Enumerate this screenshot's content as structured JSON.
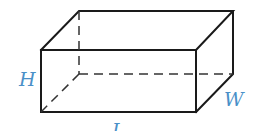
{
  "figure": {
    "labels": {
      "height": "H",
      "width": "W",
      "length": "L"
    },
    "colors": {
      "edge": "#1a1a1a",
      "label": "#4a90c8"
    }
  }
}
